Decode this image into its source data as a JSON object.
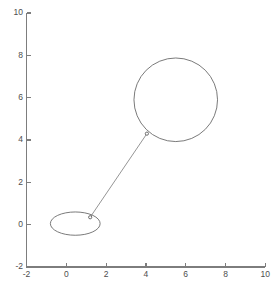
{
  "chart_data": {
    "type": "scatter",
    "title": "",
    "xlabel": "",
    "ylabel": "",
    "xlim": [
      -2,
      10
    ],
    "ylim": [
      -2,
      10
    ],
    "grid": false,
    "legend": null,
    "x_ticks": [
      -2,
      0,
      2,
      4,
      6,
      8,
      10
    ],
    "y_ticks": [
      -2,
      0,
      2,
      4,
      6,
      8,
      10
    ],
    "x_tick_labels": [
      "-2",
      "0",
      "2",
      "4",
      "6",
      "8",
      "10"
    ],
    "y_tick_labels": [
      "-2",
      "0",
      "2",
      "4",
      "6",
      "8",
      "10"
    ],
    "series": [
      {
        "name": "balloon-circle",
        "shape": "circle",
        "center": [
          5.5,
          5.9
        ],
        "radius": 2.1
      },
      {
        "name": "base-ellipse",
        "shape": "ellipse",
        "center": [
          0.45,
          0.05
        ],
        "radius_x": 1.25,
        "radius_y": 0.55
      },
      {
        "name": "tether",
        "shape": "line",
        "x": [
          1.2,
          4.05
        ],
        "y": [
          0.35,
          4.3
        ]
      },
      {
        "name": "anchor-points",
        "shape": "markers",
        "x": [
          1.2,
          4.05
        ],
        "y": [
          0.35,
          4.3
        ],
        "marker_size": 3.2
      }
    ],
    "colors": {
      "axis": "#7d7d7d",
      "tick_label": "#4d4d4d",
      "outline": "#6b6b6b",
      "tether": "#7a7a7a",
      "marker_fill": "#fdfdfd",
      "marker_edge": "#5d5d5d",
      "background": "#ffffff"
    }
  }
}
